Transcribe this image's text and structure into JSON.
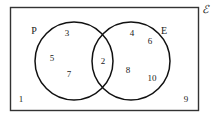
{
  "diagram": {
    "type": "venn-diagram",
    "universe": {
      "symbol": "ℰ",
      "name": "universal-set-label"
    },
    "rectangle": {
      "stroke_color": "#333333"
    },
    "sets": [
      {
        "id": "P",
        "label": "P",
        "position": "left",
        "stroke_color": "#111111"
      },
      {
        "id": "E",
        "label": "E",
        "position": "right",
        "stroke_color": "#111111"
      }
    ],
    "regions": [
      {
        "id": "p-only",
        "name": "P only",
        "members": [
          "3",
          "5",
          "7"
        ]
      },
      {
        "id": "intersection",
        "name": "P and E",
        "members": [
          "2"
        ]
      },
      {
        "id": "e-only",
        "name": "E only",
        "members": [
          "4",
          "6",
          "8",
          "10"
        ]
      },
      {
        "id": "outside",
        "name": "Outside both sets",
        "members": [
          "1",
          "9"
        ]
      }
    ],
    "elements": [
      {
        "key": "n3",
        "value": "3",
        "region": "p-only",
        "x": 67,
        "y": 33
      },
      {
        "key": "n5",
        "value": "5",
        "region": "p-only",
        "x": 52,
        "y": 58
      },
      {
        "key": "n7",
        "value": "7",
        "region": "p-only",
        "x": 69,
        "y": 74
      },
      {
        "key": "n2",
        "value": "2",
        "region": "intersection",
        "x": 103,
        "y": 61
      },
      {
        "key": "n4",
        "value": "4",
        "region": "e-only",
        "x": 132,
        "y": 33
      },
      {
        "key": "n6",
        "value": "6",
        "region": "e-only",
        "x": 150,
        "y": 41
      },
      {
        "key": "n8",
        "value": "8",
        "region": "e-only",
        "x": 128,
        "y": 70
      },
      {
        "key": "n10",
        "value": "10",
        "region": "e-only",
        "x": 152,
        "y": 78
      },
      {
        "key": "n1",
        "value": "1",
        "region": "outside",
        "x": 21,
        "y": 99
      },
      {
        "key": "n9",
        "value": "9",
        "region": "outside",
        "x": 186,
        "y": 99
      }
    ],
    "set_label_positions": {
      "P": {
        "x": 34,
        "y": 31
      },
      "E": {
        "x": 164,
        "y": 31
      }
    },
    "universe_label_position": {
      "x": 205,
      "y": 9
    }
  }
}
